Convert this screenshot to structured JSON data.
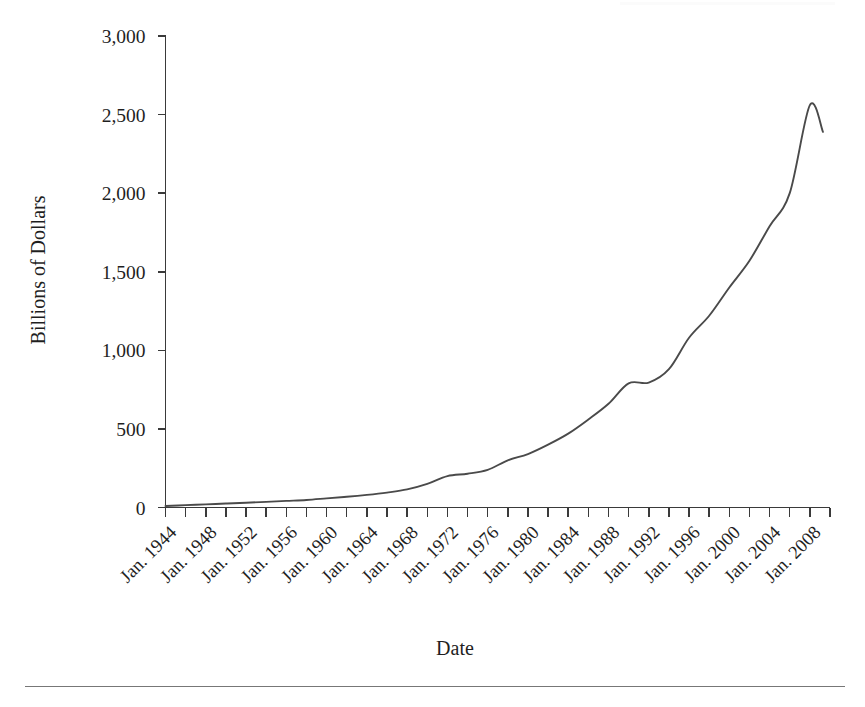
{
  "figure": {
    "background_color": "#ffffff",
    "line_color": "#4a4a4a",
    "axis_color": "#3a3a3a",
    "rule_color": "#777777",
    "has_bottom_rule": true
  },
  "chart_data": {
    "type": "line",
    "title": "",
    "subtitle": "",
    "xlabel": "Date",
    "ylabel": "Billions of Dollars",
    "ylim": [
      0,
      3000
    ],
    "ytick_labels": [
      "0",
      "500",
      "1,000",
      "1,500",
      "2,000",
      "2,500",
      "3,000"
    ],
    "ytick_values": [
      0,
      500,
      1000,
      1500,
      2000,
      2500,
      3000
    ],
    "xlim": [
      "Jan. 1944",
      "Jan. 2010"
    ],
    "xtick_labels": [
      "Jan. 1944",
      "Jan. 1948",
      "Jan. 1952",
      "Jan. 1956",
      "Jan. 1960",
      "Jan. 1964",
      "Jan. 1968",
      "Jan. 1972",
      "Jan. 1976",
      "Jan. 1980",
      "Jan. 1984",
      "Jan. 1988",
      "Jan. 1992",
      "Jan. 1996",
      "Jan. 2000",
      "Jan. 2004",
      "Jan. 2008"
    ],
    "xtick_label_rotation_deg": 45,
    "minor_tick_interval_years": 2,
    "grid": false,
    "legend": false,
    "x": [
      1944,
      1946,
      1948,
      1950,
      1952,
      1954,
      1956,
      1958,
      1960,
      1962,
      1964,
      1966,
      1968,
      1970,
      1972,
      1974,
      1976,
      1978,
      1980,
      1982,
      1984,
      1986,
      1988,
      1990,
      1992,
      1994,
      1996,
      1998,
      2000,
      2002,
      2004,
      2006,
      2008,
      2009
    ],
    "values": [
      10,
      15,
      20,
      25,
      30,
      36,
      42,
      48,
      58,
      68,
      80,
      95,
      115,
      150,
      200,
      215,
      240,
      300,
      340,
      400,
      470,
      560,
      660,
      790,
      795,
      880,
      1080,
      1220,
      1400,
      1570,
      1790,
      2000,
      2210,
      2390
    ],
    "series": [
      {
        "name": "Billions of Dollars",
        "values": [
          10,
          15,
          20,
          25,
          30,
          36,
          42,
          48,
          58,
          68,
          80,
          95,
          115,
          150,
          200,
          215,
          240,
          300,
          340,
          400,
          470,
          560,
          660,
          790,
          795,
          880,
          1080,
          1220,
          1400,
          1570,
          1790,
          2000,
          2210,
          2390
        ]
      }
    ],
    "annotations": [
      {
        "label": "plateau",
        "x": 1978,
        "y": 340
      },
      {
        "label": "plateau",
        "x": 1990,
        "y": 795
      },
      {
        "label": "peak",
        "x": 2008,
        "y": 2560
      },
      {
        "label": "end",
        "x": 2009,
        "y": 2390
      }
    ],
    "peak_value": 2560,
    "peak_x": "Jan. 2008",
    "end_value": 2390,
    "start_value": 10
  }
}
